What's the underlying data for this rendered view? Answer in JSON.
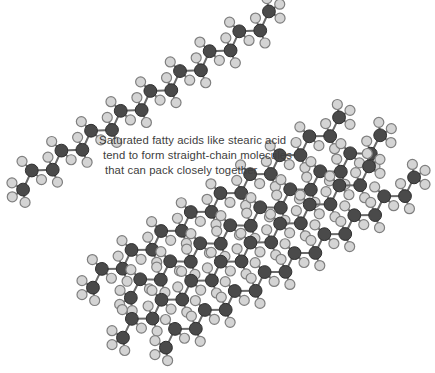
{
  "figure": {
    "background": "#ffffff",
    "annotation": {
      "lines": [
        "Saturated fatty acids like stearic acid",
        "tend to form straight-chain molecules",
        "that can pack closely together"
      ],
      "text_color": "#404040"
    },
    "style": {
      "carbon_color": "#4a4a4a",
      "carbon_edge": "#2f2f2f",
      "hydrogen_color": "#d4d4d4",
      "hydrogen_edge": "#7f7f7f",
      "bond_color": "#6a6a6a",
      "bond_width": 2,
      "carbon_radius": 6.4,
      "hydrogen_radius": 5,
      "zigzag_amplitude": 5.5,
      "ch_bond_length": 13,
      "terminal_fan_degrees": [
        -65,
        0,
        65
      ]
    },
    "chains": [
      {
        "id": "single-stearic-chain",
        "carbons": 18,
        "from": [
          20,
          185
        ],
        "to": [
          272,
          16
        ]
      },
      {
        "id": "packed-chain-1",
        "carbons": 18,
        "from": [
          90,
          283
        ],
        "to": [
          342,
          122
        ]
      },
      {
        "id": "packed-chain-2",
        "carbons": 18,
        "from": [
          128,
          293
        ],
        "to": [
          383,
          140
        ]
      },
      {
        "id": "packed-chain-3",
        "carbons": 18,
        "from": [
          120,
          333
        ],
        "to": [
          372,
          171
        ]
      },
      {
        "id": "packed-chain-4",
        "carbons": 18,
        "from": [
          163,
          343
        ],
        "to": [
          417,
          182
        ]
      }
    ],
    "atoms_legend": {
      "carbon": "dark-gray-sphere",
      "hydrogen": "light-gray-sphere"
    }
  }
}
